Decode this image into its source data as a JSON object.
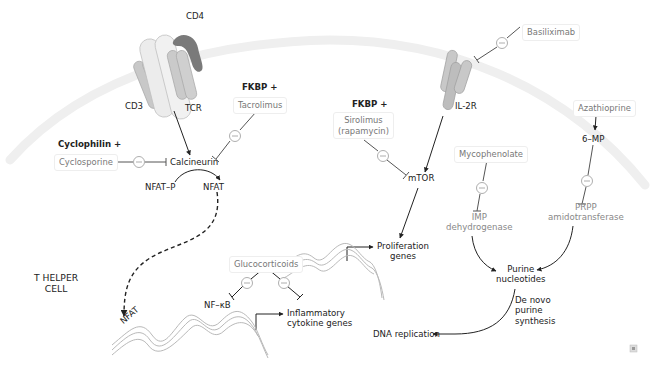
{
  "diagram": {
    "title_label": "T HELPER\nCELL",
    "colors": {
      "membrane": "#ececec",
      "receptor_light": "#e2e2e2",
      "receptor_mid": "#c4c4c4",
      "cd4": "#7a7a7a",
      "arrow": "#222222",
      "drug_text": "#777777"
    },
    "receptors": {
      "cd4": "CD4",
      "cd3": "CD3",
      "tcr": "TCR",
      "il2r": "IL-2R"
    },
    "drugs": {
      "cyclosporine": {
        "partner": "Cyclophilin +",
        "name": "Cyclosporine"
      },
      "tacrolimus": {
        "partner": "FKBP +",
        "name": "Tacrolimus"
      },
      "sirolimus": {
        "partner": "FKBP +",
        "name_line1": "Sirolimus",
        "name_line2": "(rapamycin)"
      },
      "basiliximab": {
        "name": "Basiliximab"
      },
      "mycophenolate": {
        "name": "Mycophenolate"
      },
      "azathioprine": {
        "name": "Azathioprine"
      },
      "glucocorticoids": {
        "name": "Glucocorticoids"
      }
    },
    "nodes": {
      "calcineurin": "Calcineurin",
      "nfat_p": "NFAT–P",
      "nfat": "NFAT",
      "nfat_nucleus": "NFAT",
      "mtor": "mTOR",
      "six_mp": "6–MP",
      "imp_line1": "IMP",
      "imp_line2": "dehydrogenase",
      "prpp_line1": "PRPP",
      "prpp_line2": "amidotransferase",
      "purine_line1": "Purine",
      "purine_line2": "nucleotides",
      "denovo_line1": "De novo",
      "denovo_line2": "purine",
      "denovo_line3": "synthesis",
      "dna_replication": "DNA replication",
      "prolif_line1": "Proliferation",
      "prolif_line2": "genes",
      "nfkb": "NF–κB",
      "inflam_line1": "Inflammatory",
      "inflam_line2": "cytokine genes"
    },
    "cell_label_line1": "T HELPER",
    "cell_label_line2": "CELL",
    "inhibit_symbol": "–"
  }
}
